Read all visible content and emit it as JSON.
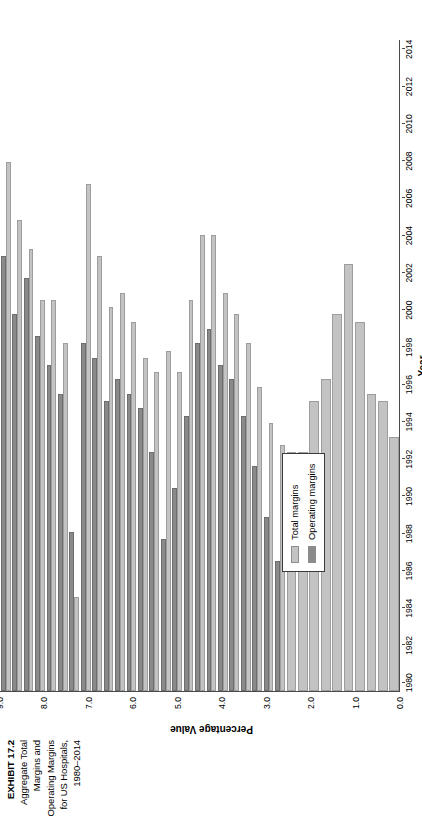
{
  "exhibit": {
    "number": "EXHIBIT 17.2",
    "caption": "Aggregate Total Margins and Operating Margins for US Hospitals, 1980–2014"
  },
  "legend": {
    "position": "inside-bottom-left",
    "items": [
      {
        "label": "Total margins",
        "color": "#c3c3c3",
        "key": "total"
      },
      {
        "label": "Operating margins",
        "color": "#8a8a8a",
        "key": "operating"
      }
    ]
  },
  "axes": {
    "value_axis_title": "Percentage Value",
    "category_axis_title": "Year",
    "value_ticks": [
      "0.0",
      "1.0",
      "2.0",
      "3.0",
      "4.0",
      "5.0",
      "6.0",
      "7.0",
      "8.0",
      "9.0"
    ],
    "category_ticks": [
      "1980",
      "1982",
      "1984",
      "1986",
      "1988",
      "1990",
      "1992",
      "1994",
      "1996",
      "1998",
      "2000",
      "2002",
      "2004",
      "2006",
      "2008",
      "2010",
      "2012",
      "2014"
    ]
  },
  "chart_data": {
    "type": "bar",
    "orientation": "horizontal",
    "title": "Aggregate Total Margins and Operating Margins for US Hospitals, 1980–2014",
    "xlabel": "Year",
    "ylabel": "Percentage Value",
    "ylim": [
      0.0,
      9.0
    ],
    "ytick_step": 1.0,
    "grid": false,
    "legend_position": "inside-bottom-left",
    "categories": [
      "1980",
      "1981",
      "1982",
      "1983",
      "1984",
      "1985",
      "1986",
      "1987",
      "1988",
      "1989",
      "1990",
      "1991",
      "1992",
      "1993",
      "1994",
      "1995",
      "1996",
      "1997",
      "1998",
      "1999",
      "2000",
      "2001",
      "2002",
      "2003",
      "2004",
      "2005",
      "2006",
      "2007",
      "2008",
      "2009",
      "2010",
      "2011",
      "2012",
      "2013",
      "2014"
    ],
    "series": [
      {
        "name": "Total margins",
        "color": "#c3c3c3",
        "values": [
          3.5,
          4.0,
          4.1,
          5.1,
          5.9,
          5.2,
          4.3,
          4.0,
          3.3,
          3.3,
          3.4,
          3.7,
          4.2,
          4.8,
          5.2,
          5.5,
          6.3,
          6.3,
          5.4,
          4.4,
          4.7,
          4.4,
          4.6,
          5.1,
          5.5,
          5.3,
          6.0,
          7.0,
          1.3,
          4.8,
          5.4,
          5.4,
          6.1,
          6.5,
          7.3
        ]
      },
      {
        "name": "Operating margins",
        "color": "#8a8a8a",
        "values": [
          null,
          null,
          null,
          null,
          null,
          null,
          null,
          null,
          null,
          null,
          1.8,
          2.4,
          3.1,
          3.8,
          4.3,
          4.5,
          5.0,
          4.8,
          3.8,
          2.8,
          2.1,
          3.3,
          3.9,
          4.1,
          4.3,
          4.0,
          4.6,
          4.8,
          2.2,
          4.1,
          4.5,
          4.9,
          5.7,
          5.2,
          6.0
        ]
      }
    ]
  }
}
